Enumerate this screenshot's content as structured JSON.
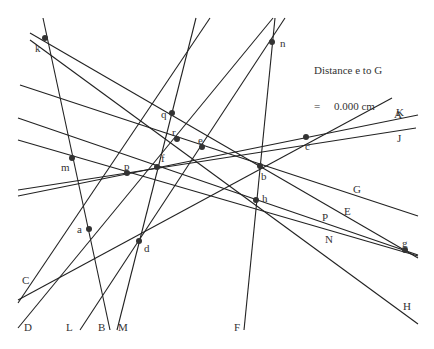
{
  "readout": {
    "line1": "Distance e to G",
    "line2": "=     0.000 cm"
  },
  "points": [
    {
      "name": "k",
      "x": 45,
      "y": 38,
      "lx": 35,
      "ly": 52
    },
    {
      "name": "n",
      "x": 272,
      "y": 42,
      "lx": 280,
      "ly": 47
    },
    {
      "name": "q",
      "x": 172,
      "y": 113,
      "lx": 161,
      "ly": 118
    },
    {
      "name": "r",
      "x": 177,
      "y": 139,
      "lx": 172,
      "ly": 136
    },
    {
      "name": "e",
      "x": 202,
      "y": 147,
      "lx": 198,
      "ly": 144
    },
    {
      "name": "c",
      "x": 306,
      "y": 137,
      "lx": 305,
      "ly": 150
    },
    {
      "name": "m",
      "x": 72,
      "y": 158,
      "lx": 61,
      "ly": 171
    },
    {
      "name": "p",
      "x": 127,
      "y": 173,
      "lx": 124,
      "ly": 170
    },
    {
      "name": "f",
      "x": 157,
      "y": 167,
      "lx": 161,
      "ly": 162
    },
    {
      "name": "b",
      "x": 260,
      "y": 166,
      "lx": 261,
      "ly": 180
    },
    {
      "name": "h",
      "x": 256,
      "y": 200,
      "lx": 262,
      "ly": 202
    },
    {
      "name": "a",
      "x": 89,
      "y": 229,
      "lx": 77,
      "ly": 233
    },
    {
      "name": "d",
      "x": 139,
      "y": 241,
      "lx": 144,
      "ly": 252
    },
    {
      "name": "g",
      "x": 405,
      "y": 250,
      "lx": 402,
      "ly": 247
    }
  ],
  "lines": [
    {
      "label": "A",
      "x1": 18,
      "y1": 300,
      "x2": 392,
      "y2": 98,
      "lx": 394,
      "ly": 118
    },
    {
      "label": "K",
      "x1": 18,
      "y1": 196,
      "x2": 418,
      "y2": 115,
      "lx": 396,
      "ly": 116
    },
    {
      "label": "J",
      "x1": 18,
      "y1": 190,
      "x2": 416,
      "y2": 128,
      "lx": 397,
      "ly": 142
    },
    {
      "label": "C",
      "x1": 18,
      "y1": 303,
      "x2": 210,
      "y2": 18,
      "lx": 22,
      "ly": 284
    },
    {
      "label": "D",
      "x1": 18,
      "y1": 328,
      "x2": 273,
      "y2": 18,
      "lx": 24,
      "ly": 331
    },
    {
      "label": "L",
      "x1": 80,
      "y1": 330,
      "x2": 285,
      "y2": 18,
      "lx": 66,
      "ly": 331
    },
    {
      "label": "B",
      "x1": 43,
      "y1": 18,
      "x2": 110,
      "y2": 330,
      "lx": 98,
      "ly": 331
    },
    {
      "label": "M",
      "x1": 117,
      "y1": 330,
      "x2": 196,
      "y2": 18,
      "lx": 118,
      "ly": 331
    },
    {
      "label": "F",
      "x1": 244,
      "y1": 330,
      "x2": 275,
      "y2": 18,
      "lx": 234,
      "ly": 331
    },
    {
      "label": "G",
      "x1": 20,
      "y1": 85,
      "x2": 418,
      "y2": 216,
      "lx": 353,
      "ly": 193
    },
    {
      "label": "E",
      "x1": 30,
      "y1": 33,
      "x2": 418,
      "y2": 258,
      "lx": 344,
      "ly": 215
    },
    {
      "label": "H",
      "x1": 30,
      "y1": 40,
      "x2": 418,
      "y2": 324,
      "lx": 403,
      "ly": 310
    },
    {
      "label": "P",
      "x1": 18,
      "y1": 118,
      "x2": 418,
      "y2": 255,
      "lx": 322,
      "ly": 221
    },
    {
      "label": "N",
      "x1": 18,
      "y1": 140,
      "x2": 418,
      "y2": 256,
      "lx": 325,
      "ly": 243
    },
    {
      "label": "",
      "x1": 18,
      "y1": 300,
      "x2": 418,
      "y2": 60,
      "lx": 0,
      "ly": 0
    }
  ]
}
